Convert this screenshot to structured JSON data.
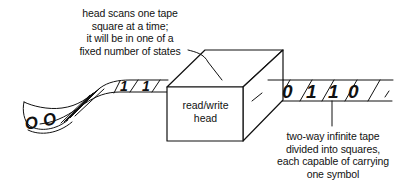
{
  "diagram": {
    "type": "turing-machine-illustration",
    "head_annotation": {
      "lines": [
        "head scans one tape",
        "square at a time;",
        "it will be in one of a",
        "fixed number of states"
      ]
    },
    "head_box": {
      "lines": [
        "read/write",
        "head"
      ]
    },
    "tape_annotation": {
      "lines": [
        "two-way infinite tape",
        "divided into squares,",
        "each capable of carrying",
        "one symbol"
      ]
    },
    "tape": {
      "left_symbols": [
        "0",
        "0",
        "1",
        "1"
      ],
      "right_symbols": [
        "0",
        "1",
        "1",
        "0"
      ]
    },
    "colors": {
      "ink": "#111111",
      "background": "#ffffff"
    }
  }
}
